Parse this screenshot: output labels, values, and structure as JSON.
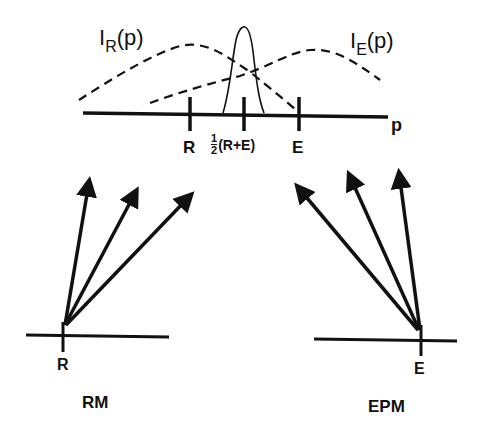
{
  "diagram": {
    "curves": {
      "left_label_main": "I",
      "left_label_sub": "R",
      "left_label_arg": "(p)",
      "right_label_main": "I",
      "right_label_sub": "E",
      "right_label_arg": "(p)"
    },
    "axis": {
      "variable": "p",
      "ticks": [
        "R",
        "½(R+E)",
        "E"
      ],
      "tick_R": "R",
      "tick_mid_frac_num": "1",
      "tick_mid_frac_den": "2",
      "tick_mid_rest": "(R+E)",
      "tick_E": "E"
    },
    "left_panel": {
      "point_label": "R",
      "title": "RM"
    },
    "right_panel": {
      "point_label": "E",
      "title": "EPM"
    },
    "colors": {
      "ink": "#111111",
      "background": "#ffffff"
    }
  }
}
